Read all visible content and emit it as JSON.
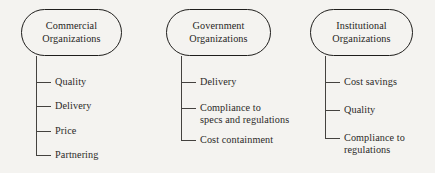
{
  "diagram": {
    "background_color": "#f4f3f0",
    "line_color": "#44423f",
    "text_color": "#2b2a28",
    "groups": [
      {
        "id": "commercial",
        "node_line_1": "Commercial",
        "node_line_2": "Organizations",
        "leaves": [
          {
            "line1": "Quality",
            "line2": ""
          },
          {
            "line1": "Delivery",
            "line2": ""
          },
          {
            "line1": "Price",
            "line2": ""
          },
          {
            "line1": "Partnering",
            "line2": ""
          }
        ]
      },
      {
        "id": "government",
        "node_line_1": "Government",
        "node_line_2": "Organizations",
        "leaves": [
          {
            "line1": "Delivery",
            "line2": ""
          },
          {
            "line1": "Compliance to",
            "line2": "specs and regulations"
          },
          {
            "line1": "Cost containment",
            "line2": ""
          }
        ]
      },
      {
        "id": "institutional",
        "node_line_1": "Institutional",
        "node_line_2": "Organizations",
        "leaves": [
          {
            "line1": "Cost savings",
            "line2": ""
          },
          {
            "line1": "Quality",
            "line2": ""
          },
          {
            "line1": "Compliance to",
            "line2": "regulations"
          }
        ]
      }
    ]
  }
}
